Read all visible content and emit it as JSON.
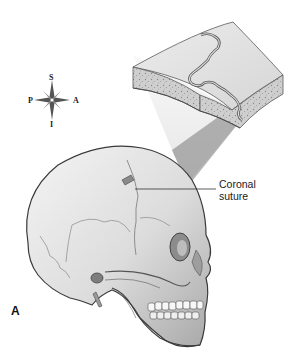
{
  "figure": {
    "panel_label": "A"
  },
  "compass": {
    "superior": "S",
    "inferior": "I",
    "posterior": "P",
    "anterior": "A"
  },
  "callouts": [
    {
      "id": "coronal-suture",
      "line1": "Coronal",
      "line2": "suture"
    }
  ],
  "colors": {
    "bone_fill": "#e6e6e6",
    "bone_shadow": "#9a9a9a",
    "outline": "#3a3a3a",
    "cancellous": "#b8b8b8",
    "zoom_beam": "#f0f0f0"
  }
}
